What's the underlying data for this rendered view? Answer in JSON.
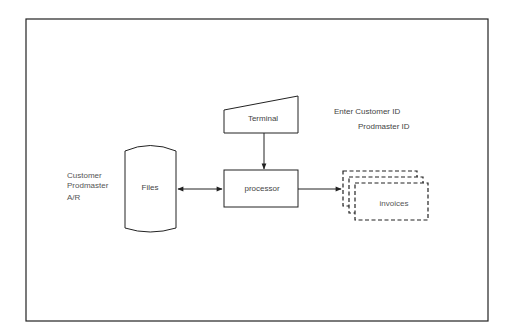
{
  "diagram": {
    "nodes": {
      "terminal": {
        "label": "Terminal",
        "shape": "manual-input"
      },
      "processor": {
        "label": "processor",
        "shape": "process-box"
      },
      "files": {
        "label": "Files",
        "shape": "storage-cylinder"
      },
      "invoices": {
        "label": "invoices",
        "shape": "multi-document-dashed"
      }
    },
    "annotations": {
      "files_list": [
        "Customer",
        "Prodmaster",
        "A/R"
      ],
      "terminal_inputs": [
        "Enter Customer ID",
        "Prodmaster ID"
      ]
    },
    "edges": [
      {
        "from": "terminal",
        "to": "processor",
        "direction": "one-way"
      },
      {
        "from": "files",
        "to": "processor",
        "direction": "two-way"
      },
      {
        "from": "processor",
        "to": "invoices",
        "direction": "one-way"
      }
    ],
    "colors": {
      "stroke": "#222222",
      "text": "#555555",
      "background": "#ffffff"
    }
  }
}
